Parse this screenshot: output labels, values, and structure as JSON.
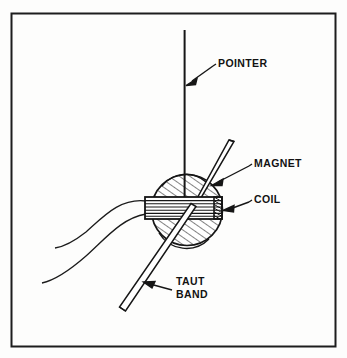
{
  "figure": {
    "kind": "technical-line-drawing",
    "background_color": "#fdfdfc",
    "ink_color": "#141414",
    "frame": {
      "name": "outer border rectangle",
      "x": 11,
      "y": 13,
      "width": 325,
      "height": 334,
      "stroke_width": 2
    }
  },
  "labels": [
    {
      "id": "pointer",
      "text": "POINTER",
      "lines": [
        "POINTER"
      ],
      "x": 218,
      "y": 63,
      "leader": {
        "from": [
          213,
          66
        ],
        "to": [
          188,
          83
        ]
      }
    },
    {
      "id": "magnet",
      "text": "MAGNET",
      "lines": [
        "MAGNET"
      ],
      "x": 254,
      "y": 163,
      "leader": {
        "from": [
          250,
          166
        ],
        "to": [
          214,
          184
        ]
      }
    },
    {
      "id": "coil",
      "text": "COIL",
      "lines": [
        "COIL"
      ],
      "x": 254,
      "y": 199,
      "leader": {
        "from": [
          250,
          202
        ],
        "to": [
          226,
          210
        ]
      }
    },
    {
      "id": "taut-band",
      "text": "TAUT BAND",
      "lines": [
        "TAUT",
        "BAND"
      ],
      "x": 176,
      "y": 284,
      "line_height": 13,
      "leader": {
        "from": [
          172,
          290
        ],
        "to": [
          146,
          284
        ]
      }
    }
  ],
  "parts": {
    "pointer": {
      "name": "pointer needle",
      "shape": "vertical line",
      "x": 184.5,
      "y_top": 30,
      "y_bottom": 208
    },
    "magnet": {
      "name": "cylindrical magnet",
      "shape": "hatched circle",
      "center": [
        187,
        210
      ],
      "radius": 36,
      "hatch_angle_deg": -55,
      "hatch_spacing": 6
    },
    "coil": {
      "name": "moving coil winding",
      "shape": "striped horizontal rectangle",
      "x": 145,
      "y": 197,
      "width": 77,
      "height": 22,
      "stripe_count": 6,
      "end_cap": {
        "x": 216,
        "width": 8,
        "style": "dark cross-hatch"
      }
    },
    "taut_band_lower": {
      "name": "lower taut band strip",
      "shape": "narrow parallelogram",
      "from": [
        188,
        206
      ],
      "to": [
        122,
        310
      ],
      "strip_width": 5
    },
    "taut_band_upper": {
      "name": "upper taut band strip",
      "shape": "narrow parallelogram",
      "from": [
        196,
        200
      ],
      "to": [
        231,
        143
      ],
      "strip_width": 5
    },
    "lead_wires": {
      "name": "coil lead wires",
      "count": 2,
      "description": "two curved wires running from the coil left edge down toward lower left"
    }
  }
}
